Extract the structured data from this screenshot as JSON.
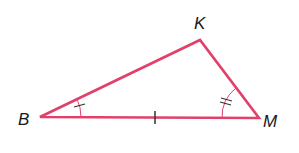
{
  "diagram": {
    "type": "triangle",
    "stroke_color": "#e0406a",
    "mark_color": "#333333",
    "vertices": [
      {
        "name": "B",
        "x": 40,
        "y": 117
      },
      {
        "name": "K",
        "x": 200,
        "y": 40
      },
      {
        "name": "M",
        "x": 259,
        "y": 118
      }
    ],
    "labels": {
      "B": "B",
      "K": "K",
      "M": "M"
    },
    "marks": {
      "side_BM": "single tick",
      "angle_B": "single arc with one tick",
      "angle_M": "single arc with two ticks"
    }
  }
}
